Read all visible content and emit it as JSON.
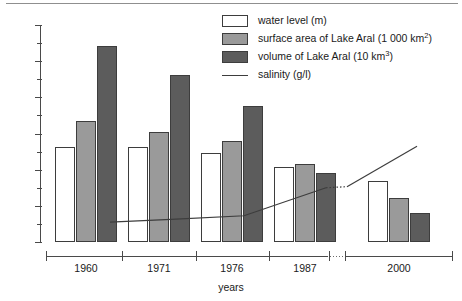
{
  "chart_data": {
    "type": "bar",
    "title": "",
    "xlabel": "years",
    "ylabel": "",
    "ylim": [
      0,
      120
    ],
    "ytick_step": 20,
    "yminor_step": 10,
    "grid": false,
    "legend_position": "top-right",
    "categories": [
      "1960",
      "1971",
      "1976",
      "1987",
      "2000"
    ],
    "ytick_labels": [
      "0",
      "20",
      "40",
      "60",
      "80",
      "100",
      "120"
    ],
    "series": [
      {
        "name": "water level (m)",
        "key": "water_level",
        "color": "#ffffff",
        "values": [
          52.5,
          52.5,
          49,
          41.5,
          34
        ]
      },
      {
        "name": "surface area of Lake Aral (1 000 km²)",
        "key": "surface_area",
        "color": "#9a9a9a",
        "values": [
          67,
          61,
          56,
          43,
          24.5
        ]
      },
      {
        "name": "volume of Lake Aral (10 km³)",
        "key": "volume",
        "color": "#5c5c5c",
        "values": [
          108.5,
          92.5,
          75,
          38,
          16
        ]
      }
    ],
    "line_series": {
      "name": "salinity (g/l)",
      "color": "#3d3d3d",
      "style": "solid-with-dotted-break",
      "values": [
        11,
        12.5,
        14.5,
        30,
        53
      ]
    },
    "axis_break": {
      "between": [
        "1987",
        "2000"
      ],
      "style": "dotted"
    }
  },
  "legend": {
    "entries": [
      {
        "swatch": "s0",
        "label_main": "water level (m)",
        "label_sup": ""
      },
      {
        "swatch": "s1",
        "label_main": "surface area of Lake Aral (1 000 km",
        "label_sup": "2",
        "label_tail": ")"
      },
      {
        "swatch": "s2",
        "label_main": "volume of Lake Aral (10 km",
        "label_sup": "3",
        "label_tail": ")"
      },
      {
        "swatch": "line",
        "label_main": "salinity (g/l)",
        "label_sup": ""
      }
    ]
  },
  "axes": {
    "x_title": "years",
    "y_max_label": "120",
    "y_min_label": "0"
  }
}
